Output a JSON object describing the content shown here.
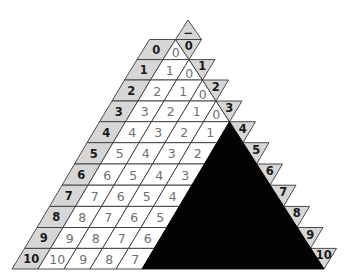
{
  "top_marker": {
    "label": "−"
  },
  "rows": [
    {
      "label": "0",
      "cells": [],
      "zero": "0",
      "right_label": "0"
    },
    {
      "label": "1",
      "cells": [
        "1"
      ],
      "zero": "0",
      "right_label": "1"
    },
    {
      "label": "2",
      "cells": [
        "2",
        "1"
      ],
      "zero": "0",
      "right_label": "2"
    },
    {
      "label": "3",
      "cells": [
        "3",
        "2",
        "1"
      ],
      "zero": "0",
      "right_label": "3"
    },
    {
      "label": "4",
      "cells": [
        "4",
        "3",
        "2",
        "1"
      ],
      "right_label": "4"
    },
    {
      "label": "5",
      "cells": [
        "5",
        "4",
        "3",
        "2"
      ],
      "right_label": "5"
    },
    {
      "label": "6",
      "cells": [
        "6",
        "5",
        "4",
        "3"
      ],
      "right_label": "6"
    },
    {
      "label": "7",
      "cells": [
        "7",
        "6",
        "5",
        "4"
      ],
      "right_label": "7"
    },
    {
      "label": "8",
      "cells": [
        "8",
        "7",
        "6",
        "5"
      ],
      "right_label": "8"
    },
    {
      "label": "9",
      "cells": [
        "9",
        "8",
        "7",
        "6"
      ],
      "right_label": "9"
    },
    {
      "label": "10",
      "cells": [
        "10",
        "9",
        "8",
        "7"
      ],
      "right_label": "10"
    }
  ],
  "masked_region": {
    "start_row": 4
  },
  "colors": {
    "header_fill": "#d6d6d6",
    "cell_fill": "#ffffff",
    "stroke": "#3a3a3a",
    "mask_fill": "#030303",
    "label_text": "#1a1a1a",
    "value_text": "#707070"
  }
}
